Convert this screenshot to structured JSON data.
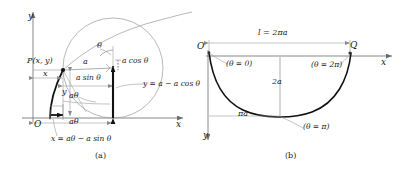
{
  "figure": {
    "caption_a": "(a)",
    "caption_b": "(b)",
    "stroke_thin": "#8a8a8a",
    "stroke_axis": "#6b6b6b",
    "stroke_bold": "#111111",
    "text_color": "#1a1a1a"
  },
  "panel_a": {
    "axis_y_label": "y",
    "axis_x_label": "x",
    "origin_label": "O",
    "point_label": "P(x, y)",
    "seg_x_label": "x",
    "seg_y_label": "y",
    "radius_label": "a",
    "angle_label": "θ",
    "a_sin_label": "a sin θ",
    "a_cos_label": "a cos θ",
    "a_theta_arc_label": "aθ",
    "a_theta_base_label": "aθ",
    "x_equation": "x = aθ − a sin θ",
    "y_equation": "y = a − a cos θ"
  },
  "panel_b": {
    "origin_label": "O",
    "end_point_label": "Q",
    "axis_x_label": "x",
    "axis_y_label": "y",
    "length_label": "l = 2πa",
    "height_label": "2a",
    "half_length_label": "πa",
    "theta_start_label": "(θ = 0)",
    "theta_end_label": "(θ = 2π)",
    "theta_mid_label": "(θ = π)"
  }
}
